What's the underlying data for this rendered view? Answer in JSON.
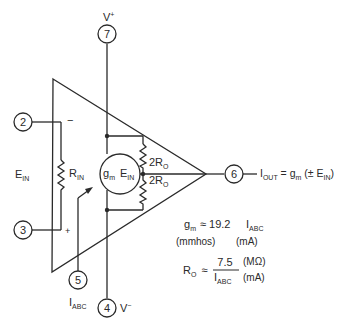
{
  "diagram": {
    "type": "OTA equivalent circuit",
    "pins": [
      {
        "id": "pin-7",
        "number": "7",
        "label": "V",
        "label_sup": "+"
      },
      {
        "id": "pin-2",
        "number": "2",
        "label": "",
        "polarity": "−"
      },
      {
        "id": "pin-3",
        "number": "3",
        "label": "",
        "polarity": "+"
      },
      {
        "id": "pin-5",
        "number": "5",
        "label": "I",
        "label_sub": "ABC"
      },
      {
        "id": "pin-4",
        "number": "4",
        "label": "V",
        "label_sup": "−"
      },
      {
        "id": "pin-6",
        "number": "6"
      }
    ],
    "input_label": {
      "main": "E",
      "sub": "IN"
    },
    "rin_label": {
      "main": "R",
      "sub": "IN"
    },
    "source_label": {
      "gm_main": "g",
      "gm_sub": "m",
      "e_main": "E",
      "e_sub": "IN"
    },
    "ro_upper": {
      "prefix": "2R",
      "sub": "O"
    },
    "ro_lower": {
      "prefix": "2R",
      "sub": "O"
    },
    "output_eq": {
      "i_main": "I",
      "i_sub": "OUT",
      "eq": " = g",
      "g_sub": "m",
      "rest": " (± E",
      "e_sub": "IN",
      "close": ")"
    }
  },
  "formulas": {
    "gm": {
      "lhs_main": "g",
      "lhs_sub": "m",
      "approx": "≈",
      "coef": "19.2",
      "var_main": "I",
      "var_sub": "ABC",
      "unit_left": "(mmhos)",
      "unit_right": "(mA)"
    },
    "ro": {
      "lhs_main": "R",
      "lhs_sub": "O",
      "approx": "≈",
      "numerator": "7.5",
      "den_main": "I",
      "den_sub": "ABC",
      "unit_top": "(MΩ)",
      "unit_bottom": "(mA)"
    }
  }
}
